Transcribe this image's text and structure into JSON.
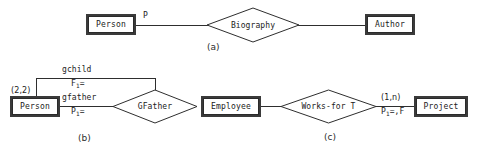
{
  "figure": {
    "type": "entity-relationship-diagram",
    "subfigures": [
      {
        "caption": "(a)",
        "entities": [
          {
            "name": "Person"
          },
          {
            "name": "Author"
          }
        ],
        "relationships": [
          {
            "name": "Biography"
          }
        ],
        "edge_labels": [
          {
            "text": "P"
          }
        ]
      },
      {
        "caption": "(b)",
        "entities": [
          {
            "name": "Person"
          }
        ],
        "relationships": [
          {
            "name": "GFather"
          }
        ],
        "edge_labels": [
          {
            "role": "gchild",
            "constraint_prefix": "F",
            "constraint_sub": "1",
            "constraint_suffix": "="
          },
          {
            "role": "gfather",
            "constraint_prefix": "P",
            "constraint_sub": "1",
            "constraint_suffix": "="
          },
          {
            "cardinality": "(2,2)"
          }
        ]
      },
      {
        "caption": "(c)",
        "entities": [
          {
            "name": "Employee"
          },
          {
            "name": "Project"
          }
        ],
        "relationships": [
          {
            "name": "Works-for T"
          }
        ],
        "edge_labels": [
          {
            "cardinality": "(1,n)",
            "constraint_prefix": "P",
            "constraint_sub": "1",
            "constraint_suffix": "=,F"
          }
        ]
      }
    ]
  },
  "a": {
    "person": "Person",
    "biography": "Biography",
    "author": "Author",
    "edge_p": "P",
    "caption": "(a)"
  },
  "b": {
    "person": "Person",
    "gfather": "GFather",
    "role_gchild": "gchild",
    "role_gfather": "gfather",
    "cardinality": "(2,2)",
    "constraint_f": "F",
    "constraint_f_sub": "1",
    "constraint_f_tail": "=",
    "constraint_p": "P",
    "constraint_p_sub": "1",
    "constraint_p_tail": "=",
    "caption": "(b)"
  },
  "c": {
    "employee": "Employee",
    "works_for": "Works-for T",
    "project": "Project",
    "cardinality": "(1,n)",
    "constraint_p": "P",
    "constraint_p_sub": "1",
    "constraint_p_tail": "=,F",
    "caption": "(c)"
  },
  "colors": {
    "stroke": "#2e2e2e",
    "text": "#1b1b1b",
    "background": "#ffffff"
  }
}
